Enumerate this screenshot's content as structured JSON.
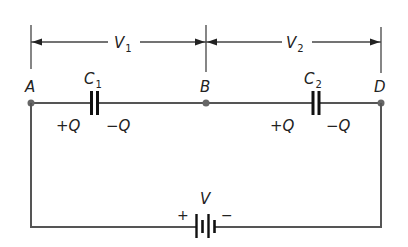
{
  "figure": {
    "type": "series-capacitor-circuit",
    "nodes": [
      {
        "id": "A",
        "label": "A"
      },
      {
        "id": "B",
        "label": "B"
      },
      {
        "id": "D",
        "label": "D"
      }
    ],
    "capacitors": [
      {
        "id": "C1",
        "label": "C",
        "subscript": "1",
        "plus_charge": "+Q",
        "minus_charge": "−Q"
      },
      {
        "id": "C2",
        "label": "C",
        "subscript": "2",
        "plus_charge": "+Q",
        "minus_charge": "−Q"
      }
    ],
    "voltages": [
      {
        "id": "V1",
        "label": "V",
        "subscript": "1",
        "from": "A",
        "to": "B"
      },
      {
        "id": "V2",
        "label": "V",
        "subscript": "2",
        "from": "B",
        "to": "D"
      }
    ],
    "battery": {
      "label": "V",
      "plus_sign": "+",
      "minus_sign": "−"
    },
    "colors": {
      "wire": "#555555",
      "ink": "#222222",
      "background": "#ffffff"
    }
  }
}
